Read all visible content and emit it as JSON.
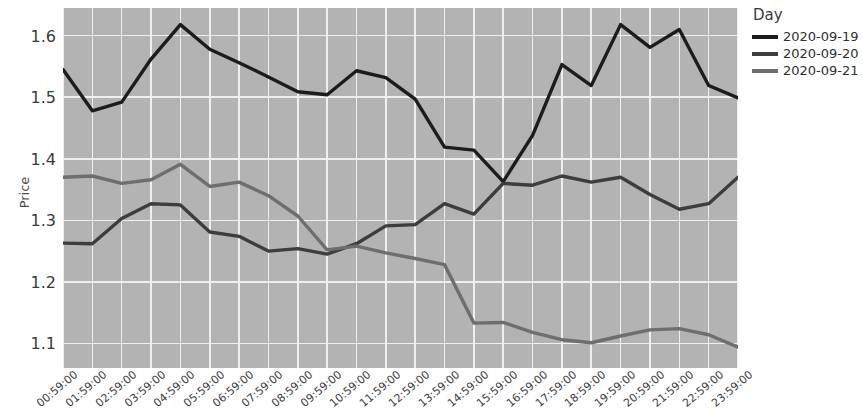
{
  "axes": {
    "ylabel": "Price",
    "yticks": [
      "1.1",
      "1.2",
      "1.3",
      "1.4",
      "1.5",
      "1.6"
    ],
    "xlabel": ""
  },
  "legend": {
    "title": "Day",
    "entries": [
      {
        "label": "2020-09-19",
        "color": "#1c1c1c"
      },
      {
        "label": "2020-09-20",
        "color": "#3d3d3d"
      },
      {
        "label": "2020-09-21",
        "color": "#6e6e6e"
      }
    ]
  },
  "chart_data": {
    "type": "line",
    "title": "",
    "xlabel": "",
    "ylabel": "Price",
    "ylim": [
      1.06,
      1.645
    ],
    "grid": true,
    "legend_position": "right",
    "legend_title": "Day",
    "categories": [
      "00:59:00",
      "01:59:00",
      "02:59:00",
      "03:59:00",
      "04:59:00",
      "05:59:00",
      "06:59:00",
      "07:59:00",
      "08:59:00",
      "09:59:00",
      "10:59:00",
      "11:59:00",
      "12:59:00",
      "13:59:00",
      "14:59:00",
      "15:59:00",
      "16:59:00",
      "17:59:00",
      "18:59:00",
      "19:59:00",
      "20:59:00",
      "21:59:00",
      "22:59:00",
      "23:59:00"
    ],
    "series": [
      {
        "name": "2020-09-19",
        "color": "#1c1c1c",
        "values": [
          1.545,
          1.478,
          1.492,
          1.562,
          1.618,
          1.578,
          1.556,
          1.533,
          1.509,
          1.504,
          1.543,
          1.532,
          1.497,
          1.419,
          1.414,
          1.363,
          1.438,
          1.553,
          1.519,
          1.618,
          1.581,
          1.61,
          1.519,
          1.499
        ]
      },
      {
        "name": "2020-09-20",
        "color": "#3d3d3d",
        "values": [
          1.263,
          1.262,
          1.303,
          1.327,
          1.325,
          1.281,
          1.274,
          1.25,
          1.254,
          1.245,
          1.262,
          1.291,
          1.293,
          1.327,
          1.31,
          1.36,
          1.357,
          1.372,
          1.362,
          1.37,
          1.342,
          1.318,
          1.327,
          1.37
        ]
      },
      {
        "name": "2020-09-21",
        "color": "#6e6e6e",
        "values": [
          1.37,
          1.372,
          1.36,
          1.366,
          1.391,
          1.355,
          1.362,
          1.34,
          1.307,
          1.252,
          1.258,
          1.247,
          1.238,
          1.228,
          1.133,
          1.134,
          1.118,
          1.106,
          1.101,
          1.112,
          1.122,
          1.124,
          1.114,
          1.094
        ]
      }
    ]
  }
}
